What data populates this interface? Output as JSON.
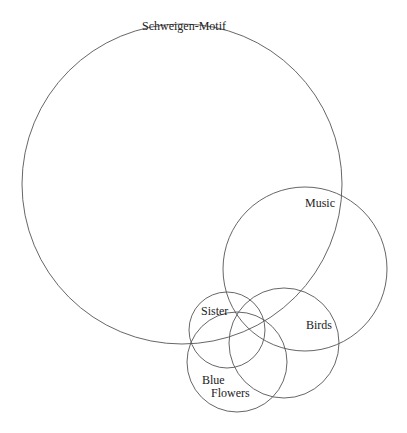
{
  "diagram": {
    "type": "venn",
    "sets": [
      {
        "id": "schweigen",
        "label": "Schweigen-Motif",
        "cx": 182,
        "cy": 184,
        "r": 160
      },
      {
        "id": "music",
        "label": "Music",
        "cx": 305,
        "cy": 269,
        "r": 82
      },
      {
        "id": "sister",
        "label": "Sister",
        "cx": 227,
        "cy": 330,
        "r": 38
      },
      {
        "id": "birds",
        "label": "Birds",
        "cx": 284,
        "cy": 343,
        "r": 55
      },
      {
        "id": "blue_flowers",
        "label": "Blue Flowers",
        "line1": "Blue",
        "line2": "Flowers",
        "cx": 237,
        "cy": 362,
        "r": 50
      }
    ]
  }
}
